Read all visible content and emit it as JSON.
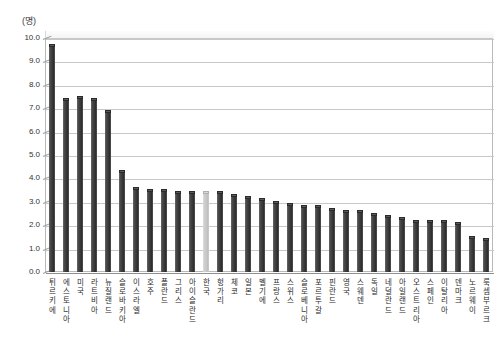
{
  "chart_data": {
    "type": "bar",
    "title": "",
    "subtitle": "",
    "xlabel": "",
    "ylabel": "",
    "unit_label": "(명)",
    "ylim": [
      0.0,
      10.0
    ],
    "ytick_labels": [
      "10.0",
      "9.0",
      "8.0",
      "7.0",
      "6.0",
      "5.0",
      "4.0",
      "3.0",
      "2.0",
      "1.0",
      "0.0"
    ],
    "ytick_values": [
      10.0,
      9.0,
      8.0,
      7.0,
      6.0,
      5.0,
      4.0,
      3.0,
      2.0,
      1.0,
      0.0
    ],
    "grid": true,
    "legend": "none",
    "highlight_category": "한국",
    "highlight_color": "#cccccc",
    "bar_color": "#3a3a3a",
    "categories": [
      "튀르키에",
      "에스토니아",
      "미국",
      "라트비아",
      "뉴질랜드",
      "슬로바키아",
      "이스라엘",
      "호주",
      "폴란드",
      "그리스",
      "아이슬란드",
      "한국",
      "헝가리",
      "체코",
      "일본",
      "벨기에",
      "프랑스",
      "스위스",
      "슬로베니아",
      "포르투갈",
      "핀란드",
      "영국",
      "스웨덴",
      "독일",
      "네덜란드",
      "아일랜드",
      "오스트리아",
      "스페인",
      "이탈리아",
      "덴마크",
      "노르웨이",
      "룩셈부르크"
    ],
    "values": [
      9.7,
      7.4,
      7.5,
      7.4,
      6.9,
      4.3,
      3.6,
      3.5,
      3.5,
      3.4,
      3.4,
      3.4,
      3.4,
      3.3,
      3.2,
      3.1,
      3.0,
      2.9,
      2.8,
      2.8,
      2.7,
      2.6,
      2.6,
      2.5,
      2.4,
      2.3,
      2.2,
      2.2,
      2.2,
      2.1,
      1.5,
      1.4
    ]
  }
}
